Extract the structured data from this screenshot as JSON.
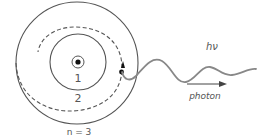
{
  "diagram": {
    "orbits": [
      {
        "label": "1"
      },
      {
        "label": "2"
      },
      {
        "label": "n = 3"
      }
    ],
    "energy_label": "hν",
    "photon_label": "photon",
    "colors": {
      "line": "#555555",
      "dot": "#111111",
      "wave": "#888888",
      "text": "#555555"
    }
  }
}
